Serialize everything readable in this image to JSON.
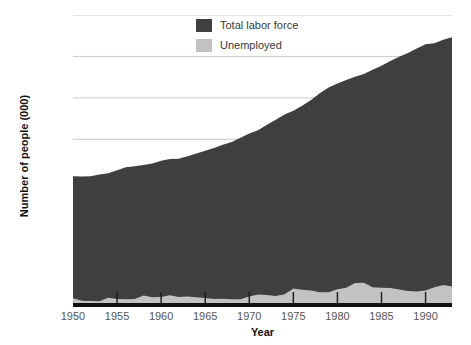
{
  "chart_data": {
    "type": "area",
    "title": "",
    "subtitle": "",
    "xlabel": "Year",
    "ylabel": "Number of people (000)",
    "xlim": [
      1950,
      1993
    ],
    "ylim": [
      0,
      140000
    ],
    "grid": true,
    "stacked": true,
    "legend_position": "top-center",
    "ytick_labels": [
      "0",
      "20000",
      "40000",
      "60000",
      "80000",
      "100000",
      "120000",
      "140000"
    ],
    "ytick_values": [
      0,
      20000,
      40000,
      60000,
      80000,
      100000,
      120000,
      140000
    ],
    "xtick_labels": [
      "1950",
      "1955",
      "1960",
      "1965",
      "1970",
      "1975",
      "1980",
      "1985",
      "1990"
    ],
    "xtick_values": [
      1950,
      1955,
      1960,
      1965,
      1970,
      1975,
      1980,
      1985,
      1990
    ],
    "x": [
      1950,
      1951,
      1952,
      1953,
      1954,
      1955,
      1956,
      1957,
      1958,
      1959,
      1960,
      1961,
      1962,
      1963,
      1964,
      1965,
      1966,
      1967,
      1968,
      1969,
      1970,
      1971,
      1972,
      1973,
      1974,
      1975,
      1976,
      1977,
      1978,
      1979,
      1980,
      1981,
      1982,
      1983,
      1984,
      1985,
      1986,
      1987,
      1988,
      1989,
      1990,
      1991,
      1992,
      1993
    ],
    "series": [
      {
        "name": "Total labor force",
        "color": "#3f3f3f",
        "values": [
          62208,
          62017,
          62138,
          63015,
          63643,
          65023,
          66552,
          66929,
          67639,
          68369,
          69628,
          70459,
          70614,
          71833,
          73091,
          74455,
          75770,
          77347,
          78737,
          80734,
          82771,
          84382,
          87034,
          89429,
          91949,
          93775,
          96158,
          99009,
          102251,
          104962,
          106940,
          108670,
          110204,
          111550,
          113544,
          115461,
          117834,
          119865,
          121669,
          123869,
          125840,
          126346,
          128105,
          129200
        ]
      },
      {
        "name": "Unemployed",
        "color": "#c2c2c2",
        "values": [
          3288,
          2055,
          1883,
          1834,
          3532,
          2852,
          2750,
          2859,
          4602,
          3740,
          3852,
          4714,
          3911,
          4070,
          3786,
          3366,
          2875,
          2975,
          2817,
          2832,
          4093,
          5016,
          4882,
          4365,
          5156,
          7929,
          7406,
          6991,
          6202,
          6137,
          7637,
          8273,
          10678,
          10717,
          8539,
          8312,
          8237,
          7425,
          6701,
          6528,
          7047,
          8628,
          9613,
          8940
        ]
      }
    ]
  }
}
